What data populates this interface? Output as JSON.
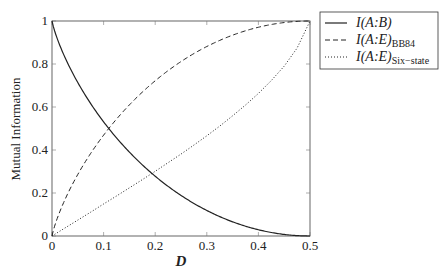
{
  "chart_data": {
    "type": "line",
    "title": "",
    "xlabel": "D",
    "ylabel": "Mutual Information",
    "xlim": [
      0,
      0.5
    ],
    "ylim": [
      0,
      1
    ],
    "xticks": [
      0,
      0.1,
      0.2,
      0.3,
      0.4,
      0.5
    ],
    "yticks": [
      0,
      0.2,
      0.4,
      0.6,
      0.8,
      1
    ],
    "xtick_labels": [
      "0",
      "0.1",
      "0.2",
      "0.3",
      "0.4",
      "0.5"
    ],
    "ytick_labels": [
      "0",
      "0.2",
      "0.4",
      "0.6",
      "0.8",
      "1"
    ],
    "grid": false,
    "legend_position": "upper right, outside plot",
    "x": [
      0,
      0.025,
      0.05,
      0.075,
      0.1,
      0.125,
      0.15,
      0.175,
      0.2,
      0.225,
      0.25,
      0.275,
      0.3,
      0.325,
      0.35,
      0.375,
      0.4,
      0.425,
      0.45,
      0.475,
      0.5
    ],
    "series": [
      {
        "name": "I(A:B)",
        "label_main": "I(A:B)",
        "label_sub": "",
        "style": "solid",
        "values": [
          1.0,
          0.831,
          0.714,
          0.616,
          0.531,
          0.456,
          0.39,
          0.331,
          0.278,
          0.231,
          0.189,
          0.151,
          0.119,
          0.09,
          0.066,
          0.046,
          0.029,
          0.016,
          0.007,
          0.002,
          0.0
        ]
      },
      {
        "name": "I(A:E)_BB84",
        "label_main": "I(A:E)",
        "label_sub": "BB84",
        "style": "dashed",
        "values": [
          0.0,
          0.169,
          0.286,
          0.384,
          0.469,
          0.544,
          0.61,
          0.669,
          0.722,
          0.769,
          0.811,
          0.849,
          0.881,
          0.91,
          0.934,
          0.954,
          0.971,
          0.984,
          0.993,
          0.998,
          1.0
        ]
      },
      {
        "name": "I(A:E)_Six-state",
        "label_main": "I(A:E)",
        "label_sub": "Six−state",
        "style": "dotted",
        "values": [
          0.0,
          0.037,
          0.074,
          0.111,
          0.149,
          0.186,
          0.224,
          0.262,
          0.301,
          0.341,
          0.381,
          0.423,
          0.466,
          0.511,
          0.559,
          0.609,
          0.663,
          0.723,
          0.79,
          0.874,
          1.0
        ]
      }
    ]
  }
}
